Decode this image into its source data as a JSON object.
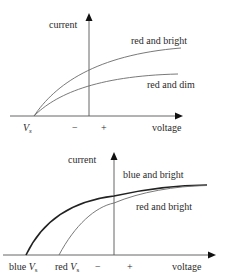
{
  "diagrams": [
    {
      "name": "top",
      "y_axis_label": "current",
      "x_axis_label": "voltage",
      "x_ticks": {
        "vs": "V",
        "vs_sub": "s",
        "minus": "−",
        "plus": "+"
      },
      "curves": [
        {
          "label": "red and bright",
          "style": "thin"
        },
        {
          "label": "red and dim",
          "style": "thin"
        }
      ]
    },
    {
      "name": "bottom",
      "y_axis_label": "current",
      "x_axis_label": "voltage",
      "x_ticks": {
        "blue_prefix": "blue ",
        "blue_vs": "V",
        "blue_vs_sub": "s",
        "red_prefix": "red ",
        "red_vs": "V",
        "red_vs_sub": "s",
        "minus": "−",
        "plus": "+"
      },
      "curves": [
        {
          "label": "blue and bright",
          "style": "thick"
        },
        {
          "label": "red and bright",
          "style": "thin"
        }
      ]
    }
  ]
}
